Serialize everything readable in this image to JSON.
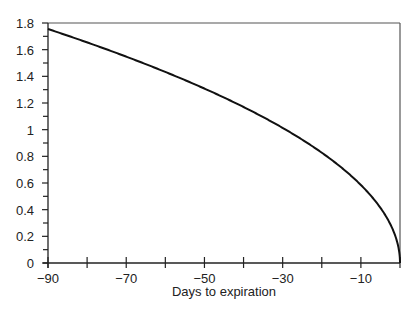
{
  "chart_data": {
    "type": "line",
    "title": "",
    "xlabel": "Days to expiration",
    "ylabel": "",
    "xlim": [
      -90,
      0
    ],
    "ylim": [
      0,
      1.8
    ],
    "grid": false,
    "legend": null,
    "x_ticks": [
      "-90",
      "-70",
      "-50",
      "-30",
      "-10"
    ],
    "y_ticks": [
      "0",
      "0.2",
      "0.4",
      "0.6",
      "0.8",
      "1",
      "1.2",
      "1.4",
      "1.6",
      "1.8"
    ],
    "series": [
      {
        "name": "time value",
        "x": [
          -90,
          -80,
          -70,
          -60,
          -50,
          -40,
          -30,
          -20,
          -10,
          -5,
          -2,
          0
        ],
        "y": [
          1.755,
          1.655,
          1.548,
          1.433,
          1.308,
          1.17,
          1.013,
          0.827,
          0.585,
          0.414,
          0.262,
          0
        ]
      }
    ]
  }
}
